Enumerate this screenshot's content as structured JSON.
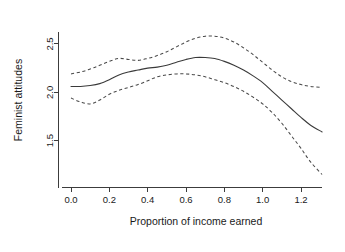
{
  "chart_data": {
    "type": "line",
    "title": "",
    "xlabel": "Proportion of income earned",
    "ylabel": "Feminist attitudes",
    "xlim": [
      -0.045,
      1.345
    ],
    "ylim": [
      1.12,
      2.66
    ],
    "xticks": [
      0.0,
      0.2,
      0.4,
      0.6,
      0.8,
      1.0,
      1.2
    ],
    "xtick_labels": [
      "0.0",
      "0.2",
      "0.4",
      "0.6",
      "0.8",
      "1.0",
      "1.2"
    ],
    "yticks": [
      1.5,
      2.0,
      2.5
    ],
    "ytick_labels": [
      "1.5",
      "2.0",
      "2.5"
    ],
    "grid": false,
    "legend": "none",
    "series": [
      {
        "name": "fit",
        "style": "solid",
        "x": [
          0.0,
          0.05,
          0.1,
          0.15,
          0.2,
          0.25,
          0.3,
          0.35,
          0.4,
          0.45,
          0.5,
          0.55,
          0.6,
          0.65,
          0.7,
          0.75,
          0.8,
          0.85,
          0.9,
          0.95,
          1.0,
          1.05,
          1.1,
          1.15,
          1.2,
          1.25,
          1.31
        ],
        "values": [
          2.06,
          2.06,
          2.07,
          2.09,
          2.13,
          2.18,
          2.21,
          2.23,
          2.25,
          2.26,
          2.28,
          2.31,
          2.34,
          2.36,
          2.36,
          2.35,
          2.32,
          2.28,
          2.23,
          2.17,
          2.1,
          2.01,
          1.92,
          1.83,
          1.74,
          1.66,
          1.59
        ]
      },
      {
        "name": "upper confidence band",
        "style": "dashed",
        "x": [
          0.0,
          0.05,
          0.1,
          0.15,
          0.2,
          0.25,
          0.3,
          0.35,
          0.4,
          0.45,
          0.5,
          0.55,
          0.6,
          0.65,
          0.7,
          0.75,
          0.8,
          0.85,
          0.9,
          0.95,
          1.0,
          1.05,
          1.1,
          1.15,
          1.2,
          1.25,
          1.31
        ],
        "values": [
          2.19,
          2.21,
          2.24,
          2.28,
          2.32,
          2.35,
          2.34,
          2.33,
          2.35,
          2.38,
          2.42,
          2.47,
          2.52,
          2.56,
          2.58,
          2.58,
          2.56,
          2.52,
          2.46,
          2.39,
          2.31,
          2.23,
          2.16,
          2.11,
          2.08,
          2.06,
          2.05
        ]
      },
      {
        "name": "lower confidence band",
        "style": "dashed",
        "x": [
          0.0,
          0.05,
          0.1,
          0.15,
          0.2,
          0.25,
          0.3,
          0.35,
          0.4,
          0.45,
          0.5,
          0.55,
          0.6,
          0.65,
          0.7,
          0.75,
          0.8,
          0.85,
          0.9,
          0.95,
          1.0,
          1.05,
          1.1,
          1.15,
          1.2,
          1.25,
          1.31
        ],
        "values": [
          1.94,
          1.9,
          1.88,
          1.92,
          1.98,
          2.02,
          2.05,
          2.08,
          2.12,
          2.16,
          2.18,
          2.19,
          2.19,
          2.18,
          2.16,
          2.13,
          2.1,
          2.06,
          2.01,
          1.95,
          1.88,
          1.79,
          1.68,
          1.55,
          1.42,
          1.28,
          1.15
        ]
      }
    ]
  }
}
